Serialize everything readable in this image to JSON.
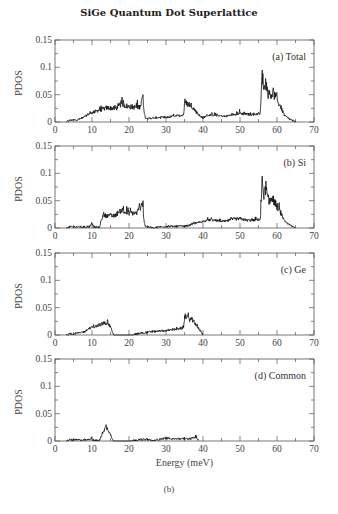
{
  "figure": {
    "title": "SiGe Quantum Dot Superlattice",
    "xlabel": "Energy (meV)",
    "caption": "(b)"
  },
  "colors": {
    "frame": "#555555",
    "curve": "#111111",
    "tick_label": "#444444"
  },
  "chart_data": [
    {
      "type": "line",
      "panel": "(a) Total",
      "title": "SiGe Quantum Dot Superlattice",
      "xlabel": "",
      "ylabel": "PDOS",
      "xlim": [
        0,
        70
      ],
      "ylim": [
        0,
        0.15
      ],
      "xticks": [
        0,
        10,
        20,
        30,
        40,
        50,
        60,
        70
      ],
      "yticks": [
        0,
        0.05,
        0.1,
        0.15
      ],
      "ytick_labels": [
        "0",
        "0.05",
        "0.1",
        "0.15"
      ],
      "grid": false,
      "legend": "(a) Total",
      "envelope": {
        "x": [
          3,
          4,
          6,
          7,
          8,
          9,
          10,
          12,
          14,
          16,
          17,
          18,
          19,
          20,
          22,
          23,
          23.7,
          24,
          24.5,
          26,
          28,
          30,
          32,
          34,
          34.8,
          35,
          36,
          37,
          38,
          39,
          40,
          41,
          42,
          44,
          46,
          48,
          50,
          52,
          54,
          55.5,
          56,
          56.5,
          57,
          57.5,
          58,
          59,
          60,
          61,
          62,
          63,
          64,
          65
        ],
        "y": [
          0,
          0.003,
          0.004,
          0.006,
          0.01,
          0.014,
          0.017,
          0.022,
          0.026,
          0.025,
          0.026,
          0.035,
          0.03,
          0.028,
          0.027,
          0.028,
          0.045,
          0.02,
          0.006,
          0.007,
          0.008,
          0.008,
          0.011,
          0.012,
          0.014,
          0.035,
          0.033,
          0.03,
          0.02,
          0.012,
          0.007,
          0.012,
          0.013,
          0.012,
          0.01,
          0.014,
          0.016,
          0.014,
          0.014,
          0.016,
          0.088,
          0.06,
          0.075,
          0.052,
          0.05,
          0.052,
          0.04,
          0.028,
          0.012,
          0.007,
          0.003,
          0
        ]
      },
      "peak_values": [
        {
          "x": 56,
          "y": 0.095
        },
        {
          "x": 23.8,
          "y": 0.05
        },
        {
          "x": 18.5,
          "y": 0.04
        },
        {
          "x": 35.2,
          "y": 0.039
        }
      ]
    },
    {
      "type": "line",
      "panel": "(b) Si",
      "xlabel": "",
      "ylabel": "PDOS",
      "xlim": [
        0,
        70
      ],
      "ylim": [
        0,
        0.15
      ],
      "xticks": [
        0,
        10,
        20,
        30,
        40,
        50,
        60,
        70
      ],
      "yticks": [
        0,
        0.05,
        0.1,
        0.15
      ],
      "ytick_labels": [
        "0",
        "0.05",
        "0.1",
        "0.15"
      ],
      "grid": false,
      "legend": "(b) Si",
      "envelope": {
        "x": [
          3,
          4,
          8,
          9.5,
          10,
          10.5,
          12,
          12.5,
          13,
          16,
          18,
          19,
          22,
          23.7,
          24,
          24.5,
          26,
          27,
          28,
          30,
          34,
          36,
          37,
          38,
          40,
          42,
          44,
          46,
          48,
          50,
          52,
          54,
          55.5,
          56,
          56.5,
          57,
          57.5,
          58,
          59,
          60,
          61,
          62,
          63,
          64,
          65
        ],
        "y": [
          0,
          0.002,
          0.002,
          0.003,
          0.009,
          0.002,
          0.001,
          0.015,
          0.023,
          0.022,
          0.033,
          0.028,
          0.027,
          0.045,
          0.015,
          0.002,
          0.001,
          0,
          0.002,
          0.003,
          0.003,
          0.004,
          0.007,
          0.009,
          0.012,
          0.015,
          0.013,
          0.012,
          0.016,
          0.017,
          0.014,
          0.014,
          0.016,
          0.088,
          0.06,
          0.075,
          0.052,
          0.05,
          0.052,
          0.04,
          0.028,
          0.012,
          0.007,
          0.003,
          0
        ]
      },
      "peak_values": [
        {
          "x": 56,
          "y": 0.095
        },
        {
          "x": 23.8,
          "y": 0.05
        },
        {
          "x": 18.5,
          "y": 0.04
        }
      ]
    },
    {
      "type": "line",
      "panel": "(c) Ge",
      "xlabel": "",
      "ylabel": "PDOS",
      "xlim": [
        0,
        70
      ],
      "ylim": [
        0,
        0.15
      ],
      "xticks": [
        0,
        10,
        20,
        30,
        40,
        50,
        60,
        70
      ],
      "yticks": [
        0,
        0.05,
        0.1,
        0.15
      ],
      "ytick_labels": [
        "0",
        "0.05",
        "0.1",
        "0.15"
      ],
      "grid": false,
      "legend": "(c) Ge",
      "envelope": {
        "x": [
          3,
          4,
          6,
          8,
          9,
          10,
          12,
          13,
          14,
          15,
          15.8,
          16,
          21,
          22,
          24,
          26,
          28,
          30,
          32,
          34,
          34.8,
          35,
          36,
          37,
          38,
          39,
          39.8,
          40
        ],
        "y": [
          0,
          0.002,
          0.003,
          0.006,
          0.011,
          0.014,
          0.018,
          0.021,
          0.023,
          0.015,
          0.001,
          0,
          0,
          0.002,
          0.004,
          0.006,
          0.007,
          0.008,
          0.01,
          0.011,
          0.014,
          0.033,
          0.03,
          0.028,
          0.02,
          0.01,
          0.002,
          0
        ]
      },
      "peak_values": [
        {
          "x": 35.2,
          "y": 0.039
        },
        {
          "x": 14.2,
          "y": 0.028
        }
      ]
    },
    {
      "type": "line",
      "panel": "(d) Common",
      "xlabel": "Energy (meV)",
      "ylabel": "PDOS",
      "xlim": [
        0,
        70
      ],
      "ylim": [
        0,
        0.15
      ],
      "xticks": [
        0,
        10,
        20,
        30,
        40,
        50,
        60,
        70
      ],
      "yticks": [
        0,
        0.05,
        0.1,
        0.15
      ],
      "ytick_labels": [
        "0",
        "0.05",
        "0.1",
        "0.15"
      ],
      "grid": false,
      "legend": "(d) Common",
      "envelope": {
        "x": [
          3,
          4,
          9,
          9.8,
          10.2,
          10.8,
          12,
          12.5,
          13,
          13.8,
          14.5,
          15,
          15.6,
          16,
          20,
          21,
          22,
          25,
          26,
          27,
          28,
          29,
          30,
          33,
          36,
          37,
          38,
          38.5,
          39
        ],
        "y": [
          0,
          0.002,
          0.002,
          0.006,
          0.002,
          0.001,
          0.001,
          0.008,
          0.018,
          0.025,
          0.02,
          0.012,
          0.002,
          0,
          0,
          0.001,
          0.002,
          0.003,
          0.001,
          0.001,
          0.003,
          0.004,
          0.005,
          0.004,
          0.004,
          0.005,
          0.007,
          0.004,
          0
        ]
      },
      "peak_values": [
        {
          "x": 13.8,
          "y": 0.03
        },
        {
          "x": 38.2,
          "y": 0.01
        }
      ]
    }
  ]
}
